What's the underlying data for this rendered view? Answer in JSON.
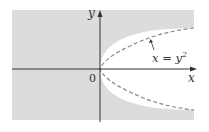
{
  "diagram": {
    "type": "region-plot",
    "axes": {
      "x_label": "x",
      "y_label": "y",
      "origin_label": "0"
    },
    "curve": {
      "equation_lhs": "x = y",
      "equation_exp": "2",
      "style": "dashed",
      "shape": "parabola opening right"
    },
    "region": {
      "description": "shaded region x < y^2 (outside parabola)",
      "fill_color": "#dcdcdc"
    },
    "colors": {
      "background": "#ffffff",
      "shade": "#dcdcdc",
      "axis": "#333333",
      "curve": "#888888"
    }
  }
}
